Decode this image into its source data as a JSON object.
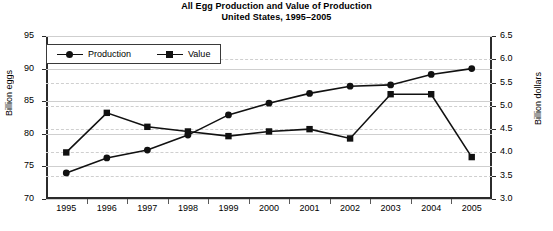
{
  "title": {
    "line1": "All Egg Production and Value of Production",
    "line2": "United States, 1995–2005"
  },
  "chart_data": {
    "type": "line",
    "xlabel": "",
    "ylabel": "Billion eggs",
    "y2label": "Billion dollars",
    "categories": [
      "1995",
      "1996",
      "1997",
      "1998",
      "1999",
      "2000",
      "2001",
      "2002",
      "2003",
      "2004",
      "2005"
    ],
    "ylim": [
      70,
      95
    ],
    "yticks": [
      "70",
      "75",
      "80",
      "85",
      "90",
      "95"
    ],
    "y2lim": [
      3.0,
      6.5
    ],
    "y2ticks": [
      "3.0",
      "3.5",
      "4.0",
      "4.5",
      "5.0",
      "5.5",
      "6.0",
      "6.5"
    ],
    "grid": true,
    "legend_position": "upper left",
    "series": [
      {
        "name": "Production",
        "axis": "left",
        "marker": "circle",
        "color": "#111111",
        "values": [
          74.0,
          76.3,
          77.5,
          79.8,
          82.9,
          84.7,
          86.2,
          87.3,
          87.5,
          89.1,
          90.0
        ]
      },
      {
        "name": "Value",
        "axis": "right",
        "marker": "square",
        "color": "#111111",
        "values": [
          4.0,
          4.85,
          4.55,
          4.45,
          4.35,
          4.45,
          4.5,
          4.3,
          5.25,
          5.25,
          3.9
        ]
      }
    ]
  }
}
